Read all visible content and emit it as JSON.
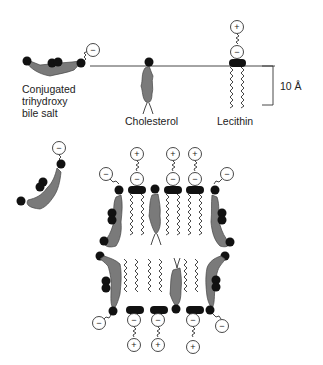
{
  "figure": {
    "labels": {
      "bile_salt": [
        "Conjugated",
        "trihydroxy",
        "bile salt"
      ],
      "cholesterol": "Cholesterol",
      "lecithin": "Lecithin",
      "scale": "10 Å"
    },
    "charges": {
      "negative": "−",
      "positive": "+"
    },
    "colors": {
      "molecule_body": "#7a7a7a",
      "polar_head": "#111111",
      "line": "#333333",
      "background": "#ffffff"
    }
  }
}
